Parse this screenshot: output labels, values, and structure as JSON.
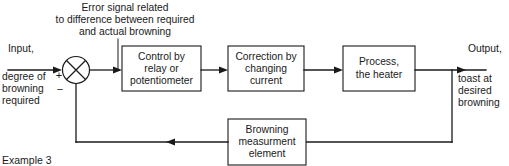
{
  "figure": {
    "caption": "Example 3",
    "annotation": {
      "line1": "Error signal related",
      "line2": "to difference between required",
      "line3": "and actual browning"
    },
    "input_label": {
      "line1": "Input,",
      "line2": "degree of",
      "line3": "browning",
      "line4": "required"
    },
    "output_label": {
      "line1": "Output,",
      "line2": "toast at",
      "line3": "desired",
      "line4": "browning"
    },
    "summing_junction": {
      "plus": "+",
      "minus": "−"
    },
    "blocks": [
      {
        "id": "control",
        "line1": "Control by",
        "line2": "relay or",
        "line3": "potentiometer"
      },
      {
        "id": "correction",
        "line1": "Correction by",
        "line2": "changing",
        "line3": "current"
      },
      {
        "id": "process",
        "line1": "Process,",
        "line2": "the heater",
        "line3": ""
      },
      {
        "id": "measurement",
        "line1": "Browning",
        "line2": "measurment",
        "line3": "element"
      }
    ],
    "colors": {
      "ink": "#1a1a1a",
      "paper": "#ffffff"
    }
  }
}
